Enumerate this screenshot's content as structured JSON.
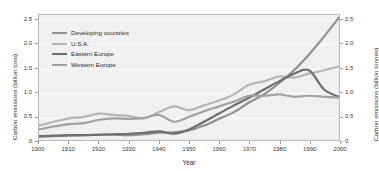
{
  "chart_data": {
    "type": "line",
    "title": "",
    "xlabel": "Year",
    "ylabel": "Carbon emissions (billion tons)",
    "ylabel_right": "Carbon emissions (billion tonnes)",
    "xlim": [
      1900,
      2000
    ],
    "ylim": [
      0,
      2.6
    ],
    "grid": true,
    "legend_position": "top-left",
    "xticks": [
      1900,
      1910,
      1920,
      1930,
      1940,
      1950,
      1960,
      1970,
      1980,
      1990,
      2000
    ],
    "xticklabels": [
      "1900",
      "1910",
      "1920",
      "1930",
      "1940",
      "1950",
      "1960",
      "1970",
      "1980",
      "1990",
      "2000"
    ],
    "yticks": [
      0,
      0.5,
      1.0,
      1.5,
      2.0,
      2.5
    ],
    "yticklabels": [
      "0",
      "0.5",
      "1.0",
      "1.5",
      "2.0",
      "2.5"
    ],
    "yticklabels_right": [
      "0",
      "0.5",
      "1.0",
      "1.5",
      "2.0",
      "2.5"
    ],
    "x": [
      1900,
      1905,
      1910,
      1915,
      1920,
      1925,
      1930,
      1935,
      1940,
      1945,
      1950,
      1955,
      1960,
      1965,
      1970,
      1975,
      1980,
      1985,
      1990,
      1995,
      2000
    ],
    "series": [
      {
        "name": "Developing countries",
        "color": "#8f8f8f",
        "values": [
          0.07,
          0.08,
          0.09,
          0.1,
          0.11,
          0.11,
          0.1,
          0.12,
          0.15,
          0.16,
          0.2,
          0.3,
          0.44,
          0.58,
          0.78,
          0.95,
          1.18,
          1.45,
          1.78,
          2.15,
          2.55
        ]
      },
      {
        "name": "U.S.A.",
        "color": "#b4b4b4",
        "values": [
          0.3,
          0.38,
          0.45,
          0.48,
          0.55,
          0.52,
          0.5,
          0.45,
          0.58,
          0.7,
          0.62,
          0.72,
          0.82,
          0.95,
          1.15,
          1.22,
          1.32,
          1.3,
          1.38,
          1.45,
          1.53
        ]
      },
      {
        "name": "Eastern Europe",
        "color": "#6e6e6e",
        "values": [
          0.08,
          0.09,
          0.1,
          0.1,
          0.11,
          0.12,
          0.13,
          0.15,
          0.18,
          0.13,
          0.22,
          0.38,
          0.55,
          0.72,
          0.88,
          1.05,
          1.22,
          1.38,
          1.45,
          1.05,
          0.9
        ]
      },
      {
        "name": "Western Europe",
        "color": "#a0a0a0",
        "values": [
          0.22,
          0.28,
          0.33,
          0.35,
          0.42,
          0.45,
          0.44,
          0.46,
          0.52,
          0.38,
          0.48,
          0.6,
          0.7,
          0.8,
          0.92,
          0.92,
          0.95,
          0.9,
          0.92,
          0.9,
          0.88
        ]
      }
    ]
  },
  "legend": {
    "items": [
      {
        "label": "Developing countries",
        "color": "#8f8f8f"
      },
      {
        "label": "U.S.A.",
        "color": "#b4b4b4"
      },
      {
        "label": "Eastern Europe",
        "color": "#6e6e6e"
      },
      {
        "label": "Western Europe",
        "color": "#a0a0a0"
      }
    ]
  },
  "colors": {
    "plot_background": "#f0f0f0",
    "page_background": "#ffffff",
    "frame": "#b8b8b8",
    "gridline": "#fafafa",
    "text": "#2b2b2b"
  }
}
